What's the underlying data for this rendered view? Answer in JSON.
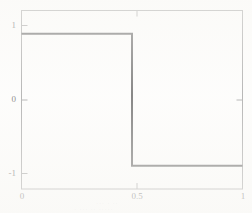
{
  "chart_data": {
    "type": "line",
    "title": "",
    "subtitle": "",
    "xlabel": "",
    "ylabel": "",
    "xlim": [
      0,
      1
    ],
    "ylim": [
      -1.35,
      1.35
    ],
    "grid": false,
    "legend": null,
    "x_ticks": [
      {
        "value": 0,
        "label": "0"
      },
      {
        "value": 0.5,
        "label": "0.5"
      },
      {
        "value": 1,
        "label": "1"
      }
    ],
    "y_ticks": [
      {
        "value": 1,
        "label": "1"
      },
      {
        "value": 0,
        "label": "0"
      },
      {
        "value": -1,
        "label": "-1"
      }
    ],
    "series": [
      {
        "name": "square-wave",
        "points": [
          {
            "x": 0.0,
            "y": 1
          },
          {
            "x": 0.5,
            "y": 1
          },
          {
            "x": 0.5,
            "y": -1
          },
          {
            "x": 1.0,
            "y": -1
          }
        ]
      }
    ],
    "annotations": [],
    "colors": {
      "line": "#555555",
      "frame": "#9a9a9a",
      "tick_label": "#5d5d5d",
      "background": "#fdfdfc"
    }
  },
  "artifacts": {
    "bleed_line_1": "··· · ··",
    "bleed_line_2": "· ···  ·· ·····"
  }
}
